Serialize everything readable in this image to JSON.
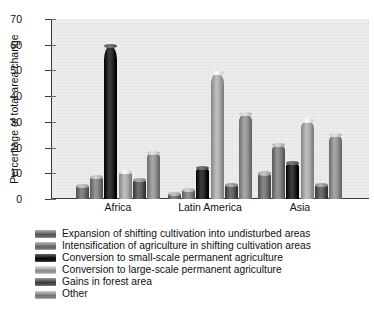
{
  "chart_data": {
    "type": "bar",
    "title": "",
    "xlabel": "",
    "ylabel": "Percentage of total area change",
    "ylim": [
      0,
      70
    ],
    "yticks": [
      0,
      10,
      20,
      30,
      40,
      50,
      60,
      70
    ],
    "grid": false,
    "legend_position": "below-plot",
    "categories": [
      "Africa",
      "Latin America",
      "Asia"
    ],
    "series": [
      {
        "name": "Expansion of shifting cultivation into undisturbed areas",
        "color": "#6f6f6f",
        "values": [
          5,
          2,
          10
        ]
      },
      {
        "name": "Intensification of agriculture in shifting cultivation areas",
        "color": "#7d7d7d",
        "values": [
          8.5,
          3.5,
          21
        ]
      },
      {
        "name": "Conversion to small-scale permanent agriculture",
        "color": "#232323",
        "values": [
          59.5,
          12,
          14
        ]
      },
      {
        "name": "Conversion to large-scale permanent agriculture",
        "color": "#a6a6a6",
        "values": [
          10.5,
          49,
          30.5
        ]
      },
      {
        "name": "Gains in forest area",
        "color": "#585858",
        "values": [
          7.5,
          5.5,
          5.5
        ]
      },
      {
        "name": "Other",
        "color": "#8e8e8e",
        "values": [
          18,
          33,
          25
        ]
      }
    ]
  },
  "axis": {
    "y_title": "Percentage of total area change",
    "y_tick_labels": [
      "70",
      "60",
      "50",
      "40",
      "30",
      "20",
      "10",
      "0"
    ],
    "x_tick_labels": [
      "Africa",
      "Latin America",
      "Asia"
    ]
  },
  "legend": {
    "items": [
      {
        "label": "Expansion of shifting cultivation into undisturbed areas",
        "color": "#6f6f6f"
      },
      {
        "label": "Intensification of agriculture in shifting cultivation areas",
        "color": "#7d7d7d"
      },
      {
        "label": "Conversion to small-scale permanent agriculture",
        "color": "#232323"
      },
      {
        "label": "Conversion to large-scale permanent agriculture",
        "color": "#a6a6a6"
      },
      {
        "label": "Gains in forest area",
        "color": "#585858"
      },
      {
        "label": "Other",
        "color": "#8e8e8e"
      }
    ]
  },
  "colors": {
    "plot_background": "#ececeb",
    "axis_line": "#3a3a3a",
    "text": "#111111"
  }
}
